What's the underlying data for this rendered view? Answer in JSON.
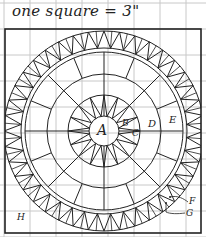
{
  "caption": "one square = 3\"",
  "grid": {
    "spacing": 26,
    "origin_x": 4,
    "origin_y": 3,
    "color": "#c8c8c8"
  },
  "border": {
    "x": 5,
    "y": 29,
    "w": 196,
    "h": 204,
    "color": "#222"
  },
  "medallion": {
    "cx": 104,
    "cy": 131,
    "rings": [
      15,
      36,
      57,
      79
    ],
    "band_inner": 83,
    "band_outer": 100,
    "spokes": 16,
    "sawtooth_count": 40,
    "line_color": "#222"
  },
  "labels": {
    "A": "A",
    "B": "B",
    "C": "C",
    "D": "D",
    "E": "E",
    "F": "F",
    "G": "G",
    "H": "H"
  }
}
